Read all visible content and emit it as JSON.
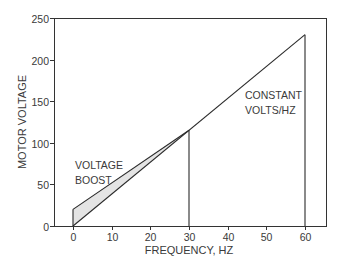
{
  "chart_data": {
    "type": "line",
    "title": "",
    "xlabel": "FREQUENCY, HZ",
    "ylabel": "MOTOR VOLTAGE",
    "xlim": [
      0,
      60
    ],
    "ylim": [
      0,
      250
    ],
    "x_ticks": [
      0,
      10,
      20,
      30,
      40,
      50,
      60
    ],
    "y_ticks": [
      0,
      50,
      100,
      150,
      200,
      250
    ],
    "grid": false,
    "legend": null,
    "series": [
      {
        "name": "Constant volts/Hz",
        "x": [
          0,
          60
        ],
        "y": [
          0,
          230
        ]
      },
      {
        "name": "Voltage boost",
        "x": [
          0,
          30
        ],
        "y": [
          20,
          115
        ]
      }
    ],
    "vertical_lines": [
      {
        "x": 0,
        "y_from": 0,
        "y_to": 20
      },
      {
        "x": 30,
        "y_from": 0,
        "y_to": 115
      },
      {
        "x": 60,
        "y_from": 0,
        "y_to": 230
      }
    ],
    "shaded_region": {
      "between": [
        "Voltage boost",
        "Constant volts/Hz"
      ],
      "x_range": [
        0,
        30
      ],
      "color": "#e4e4e4"
    },
    "annotations": [
      {
        "text_lines": [
          "VOLTAGE",
          "BOOST"
        ],
        "x": 1,
        "y": 60
      },
      {
        "text_lines": [
          "CONSTANT",
          "VOLTS/HZ"
        ],
        "x": 44,
        "y": 157
      }
    ]
  },
  "labels": {
    "xlabel": "FREQUENCY, HZ",
    "ylabel": "MOTOR VOLTAGE",
    "boost_line1": "VOLTAGE",
    "boost_line2": "BOOST",
    "const_line1": "CONSTANT",
    "const_line2": "VOLTS/HZ"
  },
  "colors": {
    "line": "#2a2a2a",
    "axis": "#333333",
    "fill": "#e4e4e4"
  }
}
